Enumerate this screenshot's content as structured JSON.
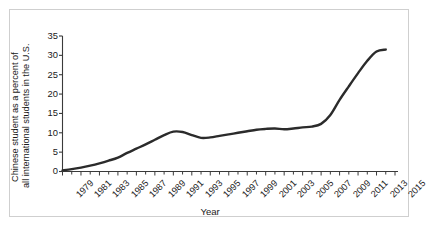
{
  "chart_data": {
    "type": "line",
    "title": "",
    "xlabel": "Year",
    "ylabel": "Chinese student as a percent of all international students in the U.S.",
    "ylabel_line1": "Chinese student as a percent of",
    "ylabel_line2": "all international students in the U.S.",
    "xlim": [
      1979,
      2015
    ],
    "ylim": [
      0,
      35
    ],
    "yticks": [
      0,
      5,
      10,
      15,
      20,
      25,
      30,
      35
    ],
    "xticks_major": [
      1979,
      1981,
      1983,
      1985,
      1987,
      1989,
      1991,
      1993,
      1995,
      1997,
      1999,
      2001,
      2003,
      2005,
      2007,
      2009,
      2011,
      2013,
      2015
    ],
    "xticks_minor": [
      1980,
      1982,
      1984,
      1986,
      1988,
      1990,
      1992,
      1994,
      1996,
      1998,
      2000,
      2002,
      2004,
      2006,
      2008,
      2010,
      2012,
      2014
    ],
    "grid": false,
    "legend": false,
    "line_color": "#2b2b2b",
    "line_width": 2.4,
    "x": [
      1979,
      1980,
      1981,
      1982,
      1983,
      1984,
      1985,
      1986,
      1987,
      1988,
      1989,
      1990,
      1991,
      1992,
      1993,
      1994,
      1995,
      1996,
      1997,
      1998,
      1999,
      2000,
      2001,
      2002,
      2003,
      2004,
      2005,
      2006,
      2007,
      2008,
      2009,
      2010,
      2011,
      2012,
      2013,
      2014
    ],
    "values": [
      0.3,
      0.6,
      1.0,
      1.5,
      2.1,
      2.8,
      3.6,
      4.8,
      5.9,
      7.0,
      8.2,
      9.4,
      10.3,
      10.2,
      9.4,
      8.7,
      8.8,
      9.2,
      9.6,
      10.0,
      10.4,
      10.8,
      11.0,
      11.1,
      10.9,
      11.1,
      11.4,
      11.6,
      12.3,
      14.6,
      18.5,
      22.0,
      25.4,
      28.6,
      31.0,
      31.5
    ],
    "series_name": "Chinese students share of U.S. international students (%)"
  },
  "figure": {
    "border_color": "#cfcfcf"
  }
}
